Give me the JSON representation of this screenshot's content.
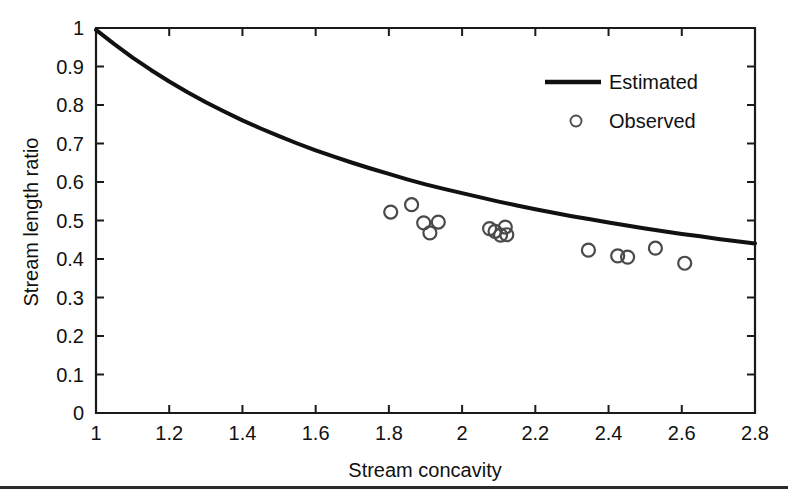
{
  "figure": {
    "background_color": "#ffffff",
    "ink_color": "#111111",
    "marker_color": "#4a4a4a",
    "footer_rule": true
  },
  "chart_data": {
    "type": "line",
    "title": "",
    "subtitle": "",
    "xlabel": "Stream concavity",
    "ylabel": "Stream length ratio",
    "xlim": [
      1,
      2.8
    ],
    "ylim": [
      0,
      1
    ],
    "grid": false,
    "legend_position": "upper-right",
    "xticks": [
      1,
      1.2,
      1.4,
      1.6,
      1.8,
      2,
      2.2,
      2.4,
      2.6,
      2.8
    ],
    "xtick_labels": [
      "1",
      "1.2",
      "1.4",
      "1.6",
      "1.8",
      "2",
      "2.2",
      "2.4",
      "2.6",
      "2.8"
    ],
    "yticks": [
      0,
      0.1,
      0.2,
      0.3,
      0.4,
      0.5,
      0.6,
      0.7,
      0.8,
      0.9,
      1
    ],
    "ytick_labels": [
      "0",
      "0.1",
      "0.2",
      "0.3",
      "0.4",
      "0.5",
      "0.6",
      "0.7",
      "0.8",
      "0.9",
      "1"
    ],
    "series": [
      {
        "name": "Estimated",
        "type": "line",
        "style": "solid",
        "color": "#111111",
        "x": [
          1.0,
          1.05,
          1.1,
          1.15,
          1.2,
          1.25,
          1.3,
          1.35,
          1.4,
          1.45,
          1.5,
          1.55,
          1.6,
          1.65,
          1.7,
          1.75,
          1.8,
          1.85,
          1.9,
          1.95,
          2.0,
          2.05,
          2.1,
          2.15,
          2.2,
          2.25,
          2.3,
          2.35,
          2.4,
          2.45,
          2.5,
          2.55,
          2.6,
          2.65,
          2.7,
          2.75,
          2.8
        ],
        "y": [
          0.995,
          0.958,
          0.923,
          0.891,
          0.861,
          0.833,
          0.807,
          0.783,
          0.76,
          0.739,
          0.719,
          0.7,
          0.682,
          0.666,
          0.65,
          0.635,
          0.621,
          0.607,
          0.594,
          0.582,
          0.571,
          0.56,
          0.549,
          0.539,
          0.529,
          0.52,
          0.511,
          0.503,
          0.495,
          0.487,
          0.479,
          0.472,
          0.465,
          0.459,
          0.452,
          0.446,
          0.44
        ]
      },
      {
        "name": "Observed",
        "type": "scatter",
        "marker": "open-circle",
        "color": "#4a4a4a",
        "points": [
          {
            "x": 1.805,
            "y": 0.522
          },
          {
            "x": 1.862,
            "y": 0.541
          },
          {
            "x": 1.895,
            "y": 0.494
          },
          {
            "x": 1.912,
            "y": 0.468
          },
          {
            "x": 1.935,
            "y": 0.496
          },
          {
            "x": 2.075,
            "y": 0.479
          },
          {
            "x": 2.09,
            "y": 0.472
          },
          {
            "x": 2.105,
            "y": 0.462
          },
          {
            "x": 2.118,
            "y": 0.483
          },
          {
            "x": 2.122,
            "y": 0.463
          },
          {
            "x": 2.345,
            "y": 0.423
          },
          {
            "x": 2.425,
            "y": 0.408
          },
          {
            "x": 2.452,
            "y": 0.405
          },
          {
            "x": 2.528,
            "y": 0.428
          },
          {
            "x": 2.608,
            "y": 0.389
          }
        ]
      }
    ],
    "legend": [
      {
        "label": "Estimated",
        "kind": "line"
      },
      {
        "label": "Observed",
        "kind": "open-circle"
      }
    ]
  }
}
